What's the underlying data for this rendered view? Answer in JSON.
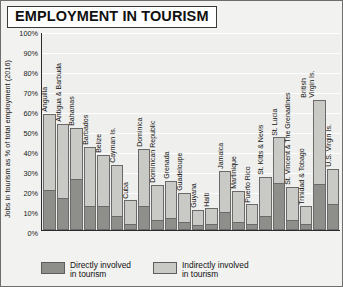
{
  "title": "EMPLOYMENT IN TOURISM",
  "axis": {
    "ylabel": "Jobs in tourism as % of total employment (2016)",
    "yticks": [
      "100%",
      "90%",
      "80%",
      "70%",
      "60%",
      "50%",
      "40%",
      "30%",
      "20%",
      "10%",
      "0%"
    ]
  },
  "legend": {
    "direct": "Directly involved\nin tourism",
    "indirect": "Indirectly involved\nin tourism"
  },
  "colors": {
    "direct": "#8e8e8b",
    "indirect": "#c9c9c6",
    "plot_background": "#efefed",
    "page_background": "#f2f2f0",
    "axis": "#2b2b2b"
  },
  "chart_data": {
    "type": "bar",
    "title": "EMPLOYMENT IN TOURISM",
    "subtitle": "",
    "xlabel": "",
    "ylabel": "Jobs in tourism as % of total employment (2016)",
    "ylim": [
      0,
      100
    ],
    "grid": true,
    "stacked": true,
    "legend_position": "bottom",
    "categories": [
      "Anguilla",
      "Antigua & Barbuda",
      "Bahamas",
      "Barbados",
      "Belize",
      "Cayman Is.",
      "Cuba",
      "Dominica",
      "Dominican Republic",
      "Grenada",
      "Guadeloupe",
      "Guyana",
      "Haiti",
      "Jamaica",
      "Martinique",
      "Puerto Rico",
      "St. Kitts & Nevis",
      "St. Lucia",
      "St. Vincent & The Grenadines",
      "Trinidad & Tobago",
      "British Virgin Is.",
      "U.S. Virgin Is."
    ],
    "series": [
      {
        "name": "Directly involved in tourism",
        "values": [
          20,
          16,
          26,
          12,
          12,
          7,
          3,
          12,
          5,
          6,
          4,
          2,
          3,
          9,
          4,
          3,
          7,
          24,
          5,
          3,
          23,
          13
        ]
      },
      {
        "name": "Indirectly involved in tourism",
        "values": [
          59,
          54,
          52,
          42,
          38,
          33,
          15,
          41,
          23,
          25,
          19,
          10,
          11,
          30,
          20,
          13,
          27,
          47,
          22,
          12,
          66,
          31
        ]
      }
    ]
  }
}
